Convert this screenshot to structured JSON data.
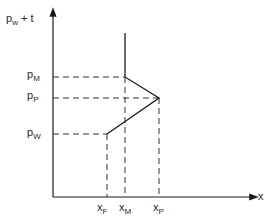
{
  "diagram": {
    "type": "piecewise-line-plot",
    "y_axis_label": {
      "main": "p",
      "sub": "w",
      "suffix": " + t"
    },
    "x_axis_label": "x",
    "y_ticks": [
      {
        "main": "p",
        "sub": "M",
        "y": 77
      },
      {
        "main": "p",
        "sub": "P",
        "y": 98
      },
      {
        "main": "p",
        "sub": "W",
        "y": 134
      }
    ],
    "x_ticks": [
      {
        "main": "x",
        "sub": "F",
        "x": 107
      },
      {
        "main": "x",
        "sub": "M",
        "x": 125
      },
      {
        "main": "x",
        "sub": "P",
        "x": 159
      }
    ],
    "curve_points": [
      {
        "x": "x_M",
        "y": "top"
      },
      {
        "x": "x_M",
        "y": "p_M"
      },
      {
        "x": "x_P",
        "y": "p_P"
      },
      {
        "x": "x_F",
        "y": "p_W"
      },
      {
        "x": "x_F",
        "y": "0"
      }
    ],
    "colors": {
      "line": "#1a1a1a",
      "dashed": "#333333",
      "background": "#ffffff"
    }
  }
}
